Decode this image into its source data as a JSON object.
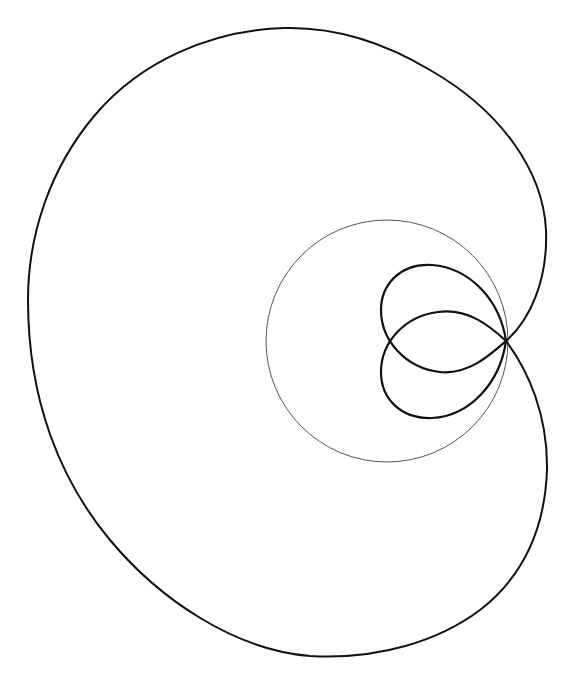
{
  "figure": {
    "background": "#ffffff",
    "curve_color": "#111111",
    "circle_color": "#555555",
    "node_point": [
      506,
      341
    ],
    "reference_circle": {
      "cx": 387,
      "cy": 341,
      "r": 121
    },
    "outer_loop_extents": {
      "left": 28,
      "top": 27,
      "right": 547,
      "bottom": 657
    },
    "inner_loops_extents": {
      "left": 381,
      "top": 265,
      "right": 506,
      "bottom": 418
    }
  }
}
